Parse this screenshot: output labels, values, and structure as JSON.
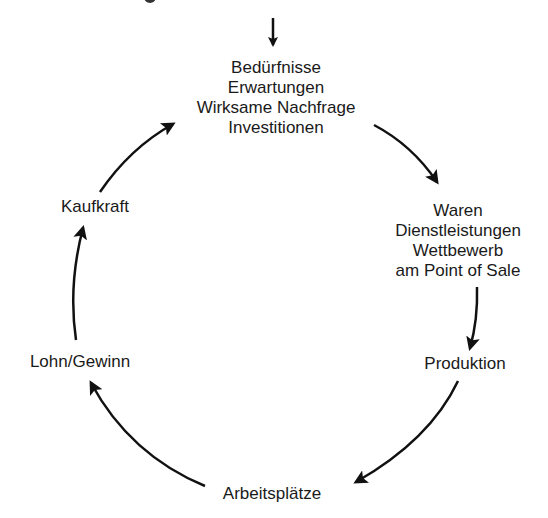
{
  "diagram": {
    "type": "cycle",
    "direction": "clockwise",
    "entry_arrow": true,
    "nodes": [
      {
        "id": "top",
        "lines": [
          "Bedürfnisse",
          "Erwartungen",
          "Wirksame Nachfrage",
          "Investitionen"
        ]
      },
      {
        "id": "right-top",
        "lines": [
          "Waren",
          "Dienstleistungen",
          "Wettbewerb",
          "am Point of Sale"
        ]
      },
      {
        "id": "right-bottom",
        "lines": [
          "Produktion"
        ]
      },
      {
        "id": "bottom",
        "lines": [
          "Arbeitsplätze"
        ]
      },
      {
        "id": "left-bottom",
        "lines": [
          "Lohn/Gewinn"
        ]
      },
      {
        "id": "left-top",
        "lines": [
          "Kaufkraft"
        ]
      }
    ],
    "edges": [
      {
        "from": "top",
        "to": "right-top"
      },
      {
        "from": "right-top",
        "to": "right-bottom"
      },
      {
        "from": "right-bottom",
        "to": "bottom"
      },
      {
        "from": "bottom",
        "to": "left-bottom"
      },
      {
        "from": "left-bottom",
        "to": "left-top"
      },
      {
        "from": "left-top",
        "to": "top"
      }
    ],
    "colors": {
      "stroke": "#111111",
      "text": "#1a1a1a",
      "background": "#ffffff"
    }
  }
}
